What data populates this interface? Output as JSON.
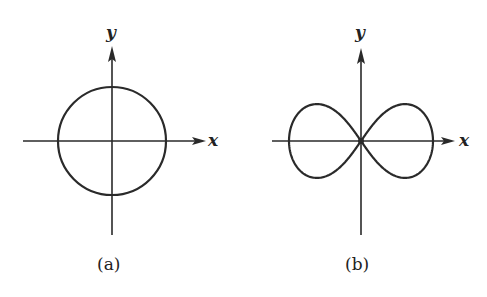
{
  "figure": {
    "panels": [
      {
        "id": "a",
        "caption": "(a)",
        "curve": "circle",
        "x_axis_label": "x",
        "y_axis_label": "y"
      },
      {
        "id": "b",
        "caption": "(b)",
        "curve": "lemniscate",
        "x_axis_label": "x",
        "y_axis_label": "y"
      }
    ]
  },
  "colors": {
    "ink": "#2a2a2a",
    "background": "#ffffff"
  }
}
